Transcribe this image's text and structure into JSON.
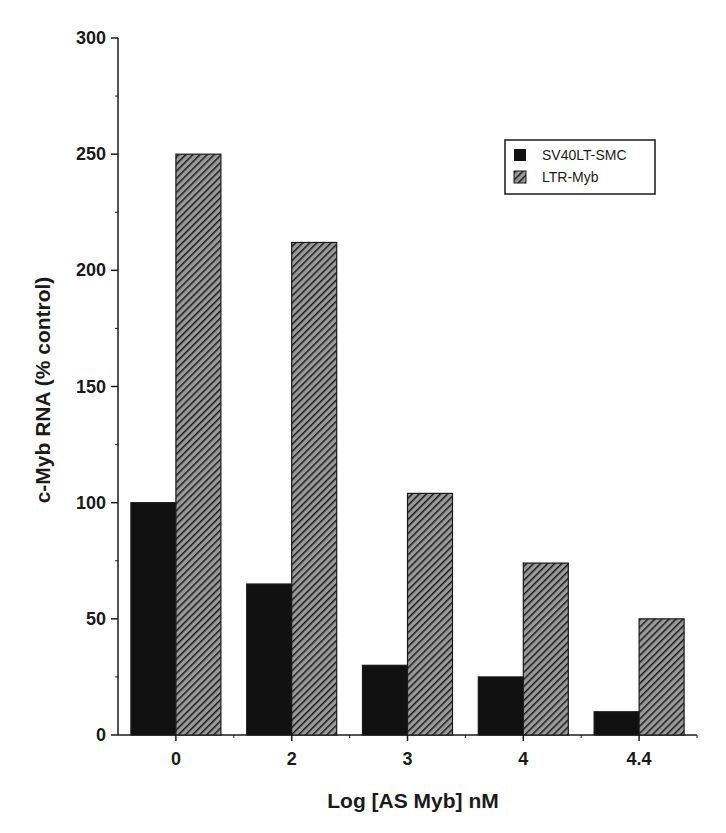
{
  "chart_data": {
    "type": "bar",
    "title": "",
    "xlabel": "Log [AS Myb] nM",
    "ylabel": "c-Myb RNA (% control)",
    "categories": [
      "0",
      "2",
      "3",
      "4",
      "4.4"
    ],
    "series": [
      {
        "name": "SV40LT-SMC",
        "values": [
          100,
          65,
          30,
          25,
          10
        ],
        "fill": "solid",
        "color": "#111111"
      },
      {
        "name": "LTR-Myb",
        "values": [
          250,
          212,
          104,
          74,
          50
        ],
        "fill": "hatched",
        "color": "#333333"
      }
    ],
    "ylim": [
      0,
      300
    ],
    "yticks": [
      0,
      50,
      100,
      150,
      200,
      250,
      300
    ],
    "grid": false,
    "legend_position": "upper right"
  },
  "legend": {
    "items": [
      {
        "label": "SV40LT-SMC"
      },
      {
        "label": "LTR-Myb"
      }
    ]
  },
  "axes": {
    "xlabel": "Log [AS Myb] nM",
    "ylabel": "c-Myb RNA (% control)"
  }
}
